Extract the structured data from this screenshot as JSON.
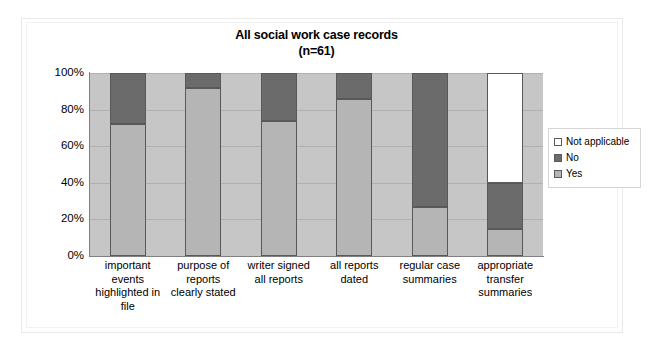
{
  "chart_data": {
    "type": "bar",
    "subtype": "stacked-100-percent",
    "title": "All social work case records",
    "subtitle": "(n=61)",
    "xlabel": "",
    "ylabel": "",
    "ylim": [
      0,
      100
    ],
    "ytick_labels": [
      "100%",
      "80%",
      "60%",
      "40%",
      "20%",
      "0%"
    ],
    "ytick_values": [
      100,
      80,
      60,
      40,
      20,
      0
    ],
    "grid": true,
    "legend_position": "right",
    "categories": [
      "important events highlighted in file",
      "purpose of reports clearly stated",
      "writer signed all reports",
      "all reports dated",
      "regular case summaries",
      "appropriate transfer summaries"
    ],
    "category_lines": [
      [
        "important",
        "events",
        "highlighted in",
        "file"
      ],
      [
        "purpose of",
        "reports",
        "clearly stated"
      ],
      [
        "writer signed",
        "all reports"
      ],
      [
        "all reports",
        "dated"
      ],
      [
        "regular case",
        "summaries"
      ],
      [
        "appropriate",
        "transfer",
        "summaries"
      ]
    ],
    "series": [
      {
        "name": "Yes",
        "color": "#b5b5b5",
        "values": [
          72,
          92,
          74,
          86,
          27,
          15
        ]
      },
      {
        "name": "No",
        "color": "#6b6b6b",
        "values": [
          28,
          8,
          26,
          14,
          73,
          25
        ]
      },
      {
        "name": "Not applicable",
        "color": "#ffffff",
        "values": [
          0,
          0,
          0,
          0,
          0,
          60
        ]
      }
    ],
    "plot_background": "#c6c6c6",
    "axis_color": "#808080"
  },
  "legend": {
    "items": [
      {
        "label": "Not applicable",
        "color": "#ffffff"
      },
      {
        "label": "No",
        "color": "#6b6b6b"
      },
      {
        "label": "Yes",
        "color": "#b5b5b5"
      }
    ]
  }
}
